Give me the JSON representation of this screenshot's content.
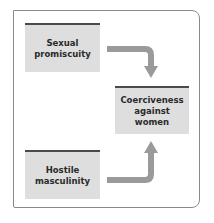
{
  "diagram": {
    "nodes": [
      {
        "id": "sexual-promiscuity",
        "lines": [
          "Sexual",
          "promiscuity"
        ]
      },
      {
        "id": "coerciveness-against-women",
        "lines": [
          "Coerciveness",
          "against",
          "women"
        ]
      },
      {
        "id": "hostile-masculinity",
        "lines": [
          "Hostile",
          "masculinity"
        ]
      }
    ],
    "edges": [
      {
        "from": "sexual-promiscuity",
        "to": "coerciveness-against-women"
      },
      {
        "from": "hostile-masculinity",
        "to": "coerciveness-against-women"
      }
    ],
    "colors": {
      "box_fill": "#dedede",
      "box_top_bar": "#4a4a4a",
      "arrow": "#9a9a9a",
      "frame": "#8a8a8a"
    }
  }
}
